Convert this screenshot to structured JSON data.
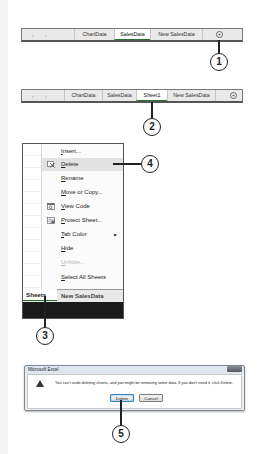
{
  "step1": {
    "tabbar": {
      "nav_arrows": "‹ ›",
      "tabs": [
        {
          "label": "ChartData",
          "active": false
        },
        {
          "label": "SalesData",
          "active": true
        },
        {
          "label": "New SalesData",
          "active": false
        }
      ],
      "new_sheet_icon": "+"
    },
    "callout": "1"
  },
  "step2": {
    "tabbar": {
      "nav_arrows": "‹ ›",
      "tabs": [
        {
          "label": "ChartData",
          "active": false
        },
        {
          "label": "SalesData",
          "active": false
        },
        {
          "label": "Sheet1",
          "active": true
        },
        {
          "label": "New SalesData",
          "active": false
        }
      ],
      "new_sheet_icon": "+"
    },
    "callout": "2"
  },
  "step3": {
    "context_menu": {
      "items": [
        {
          "label": "Insert...",
          "accel": "I",
          "rest": "nsert...",
          "icon": null,
          "highlighted": false,
          "disabled": false
        },
        {
          "label": "Delete",
          "accel": "D",
          "rest": "elete",
          "icon": "delete-sheet-icon",
          "highlighted": true,
          "disabled": false
        },
        {
          "label": "Rename",
          "accel": "R",
          "rest": "ename",
          "icon": null,
          "highlighted": false,
          "disabled": false
        },
        {
          "label": "Move or Copy...",
          "accel": "M",
          "rest": "ove or Copy...",
          "icon": null,
          "highlighted": false,
          "disabled": false
        },
        {
          "label": "View Code",
          "accel": "V",
          "rest": "iew Code",
          "icon": "view-code-icon",
          "highlighted": false,
          "disabled": false
        },
        {
          "label": "Protect Sheet...",
          "accel": "P",
          "rest": "rotect Sheet...",
          "icon": "protect-sheet-icon",
          "highlighted": false,
          "disabled": false
        },
        {
          "label": "Tab Color",
          "accel": "T",
          "rest": "ab Color",
          "icon": null,
          "highlighted": false,
          "disabled": false,
          "submenu_arrow": "▶"
        },
        {
          "label": "Hide",
          "accel": "H",
          "rest": "ide",
          "icon": null,
          "highlighted": false,
          "disabled": false
        },
        {
          "label": "Unhide...",
          "accel": "U",
          "rest": "nhide...",
          "icon": null,
          "highlighted": false,
          "disabled": true
        },
        {
          "label": "Select All Sheets",
          "accel": "S",
          "rest": "elect All Sheets",
          "icon": null,
          "highlighted": false,
          "disabled": false
        }
      ]
    },
    "sheet_tabs": {
      "active_tab": "Sheets",
      "other_tab": "New SalesData"
    },
    "callout_tab": "3",
    "callout_delete": "4"
  },
  "step5": {
    "dialog": {
      "title": "Microsoft Excel",
      "message": "You can't undo deleting sheets, and you might be removing some data. If you don't need it, click Delete.",
      "buttons": {
        "delete": "Delete",
        "cancel": "Cancel"
      }
    },
    "callout": "5"
  },
  "colors": {
    "active_tab_underline": "#2f6f2f",
    "menu_highlight": "#e2e2e2",
    "callout_stroke": "#222222",
    "dialog_titlebar": "#dfe6ee"
  }
}
